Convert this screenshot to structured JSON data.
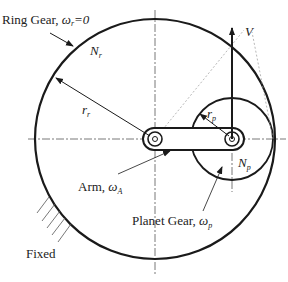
{
  "labels": {
    "ring_gear": "Ring Gear, ",
    "ring_omega": "ω",
    "ring_sub": "r",
    "ring_eq": "=0",
    "n_r": "N",
    "n_r_sub": "r",
    "r_r": "r",
    "r_r_sub": "r",
    "v": "V",
    "r_p": "r",
    "r_p_sub": "p",
    "n_p": "N",
    "n_p_sub": "p",
    "arm": "Arm, ",
    "arm_omega": "ω",
    "arm_sub": "A",
    "planet_gear": "Planet Gear, ",
    "planet_omega": "ω",
    "planet_sub": "p",
    "fixed": "Fixed"
  },
  "colors": {
    "line": "#1a1a1a",
    "thin": "#888888"
  }
}
